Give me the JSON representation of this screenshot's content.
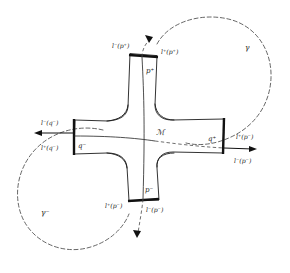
{
  "figure": {
    "background_color": "#ffffff",
    "ink_color": "#1b1b1b",
    "dashed_color": "#4a4a4a"
  },
  "labels": {
    "manifold": "ℳ",
    "top_arm_point": "p⁺",
    "bottom_arm_point": "p⁻",
    "left_arm_point": "q⁻",
    "right_arm_point": "q⁺",
    "top_left": "l⁻(p⁺)",
    "top_right": "l⁺(p⁺)",
    "left_upper": "l⁻(q⁻)",
    "left_lower": "l⁺(q⁻)",
    "right_upper": "l⁺(p⁻)",
    "right_lower": "l⁻(p⁻)",
    "bottom_left": "l⁺(p⁻)",
    "bottom_right": "l⁻(p⁻)",
    "gamma_upper_right": "γ",
    "gamma_lower_left": "γ⁻"
  },
  "elements": {
    "manifold_shape": "cross-four-arms",
    "caps": [
      "top-cap",
      "bottom-cap",
      "left-cap",
      "right-cap"
    ],
    "loops": [
      {
        "name": "gamma",
        "style": "dashed",
        "position": "upper-right"
      },
      {
        "name": "gamma-minus",
        "style": "dashed",
        "position": "lower-left"
      }
    ],
    "arrows": [
      {
        "name": "left-arrow",
        "direction": "left"
      },
      {
        "name": "right-arrow",
        "direction": "right"
      },
      {
        "name": "top-arrow",
        "direction": "down"
      },
      {
        "name": "bottom-arrow",
        "direction": "down"
      }
    ]
  }
}
